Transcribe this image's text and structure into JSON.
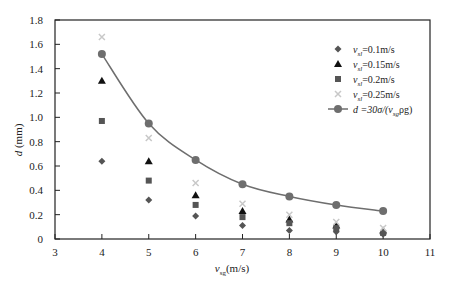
{
  "chart_data": {
    "type": "scatter",
    "title": "",
    "xlabel": "v_sg (m/s)",
    "ylabel": "d (mm)",
    "xlim": [
      3,
      11
    ],
    "ylim": [
      0,
      1.8
    ],
    "xticks": [
      3,
      4,
      5,
      6,
      7,
      8,
      9,
      10,
      11
    ],
    "yticks": [
      0,
      0.2,
      0.4,
      0.6,
      0.8,
      1.0,
      1.2,
      1.4,
      1.6,
      1.8
    ],
    "ytick_labels": [
      "0",
      "0.2",
      "0.4",
      "0.6",
      "0.8",
      "1.0",
      "1.2",
      "1.4",
      "1.6",
      "1.8"
    ],
    "legend_position": "upper right",
    "x": [
      4,
      5,
      6,
      7,
      8,
      9,
      10
    ],
    "series": [
      {
        "name": "v_sl=0.1m/s",
        "marker": "diamond",
        "color": "#555555",
        "values": [
          0.64,
          0.32,
          0.19,
          0.11,
          0.07,
          0.06,
          0.04
        ]
      },
      {
        "name": "v_sl=0.15m/s",
        "marker": "triangle",
        "color": "#111111",
        "values": [
          1.3,
          0.64,
          0.36,
          0.23,
          0.16,
          0.11,
          0.07
        ]
      },
      {
        "name": "v_sl=0.2m/s",
        "marker": "square",
        "color": "#555555",
        "values": [
          0.97,
          0.48,
          0.28,
          0.18,
          0.13,
          0.09,
          0.05
        ]
      },
      {
        "name": "v_sl=0.25m/s",
        "marker": "cross",
        "color": "#c8c8c8",
        "values": [
          1.66,
          0.83,
          0.46,
          0.29,
          0.2,
          0.14,
          0.09
        ]
      },
      {
        "name": "d=30σ/(v²_sg ρ_g)",
        "marker": "circle",
        "line": true,
        "color": "#6e6e6e",
        "values": [
          1.52,
          0.95,
          0.65,
          0.45,
          0.35,
          0.28,
          0.23
        ]
      }
    ]
  },
  "labels": {
    "ylabel_main": "d",
    "ylabel_unit": "(mm)",
    "xlabel_main": "v",
    "xlabel_sub": "sg",
    "xlabel_unit": "(m/s)",
    "legend": [
      {
        "pre": "v",
        "sub": "sl",
        "post": "=0.1m/s"
      },
      {
        "pre": "v",
        "sub": "sl",
        "post": "=0.15m/s"
      },
      {
        "pre": "v",
        "sub": "sl",
        "post": "=0.2m/s"
      },
      {
        "pre": "v",
        "sub": "sl",
        "post": "=0.25m/s"
      },
      {
        "pre": "d =30σ/(v",
        "sub": "sg",
        "post": "ρg)"
      }
    ]
  }
}
